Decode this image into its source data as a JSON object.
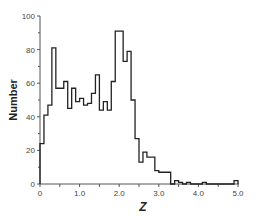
{
  "chart_data": {
    "type": "bar",
    "subtype": "step-histogram",
    "title": "",
    "xlabel": "Z",
    "ylabel": "Number",
    "xlim": [
      0,
      5.0
    ],
    "ylim": [
      0,
      100
    ],
    "bin_width": 0.1,
    "x_ticks": [
      0,
      1.0,
      2.0,
      3.0,
      4.0,
      5.0
    ],
    "x_tick_labels": [
      "0",
      "1.0",
      "2.0",
      "3.0",
      "4.0",
      "5.0"
    ],
    "y_ticks": [
      0,
      20,
      40,
      60,
      80,
      100
    ],
    "y_tick_labels": [
      "0",
      "20",
      "40",
      "60",
      "80",
      "100"
    ],
    "grid": false,
    "legend": null,
    "bin_starts": [
      0.0,
      0.1,
      0.2,
      0.3,
      0.4,
      0.5,
      0.6,
      0.7,
      0.8,
      0.9,
      1.0,
      1.1,
      1.2,
      1.3,
      1.4,
      1.5,
      1.6,
      1.7,
      1.8,
      1.9,
      2.0,
      2.1,
      2.2,
      2.3,
      2.4,
      2.5,
      2.6,
      2.7,
      2.8,
      2.9,
      3.0,
      3.1,
      3.2,
      3.3,
      3.4,
      3.5,
      3.6,
      3.7,
      3.8,
      3.9,
      4.0,
      4.1,
      4.2,
      4.3,
      4.4,
      4.5,
      4.6,
      4.7,
      4.8,
      4.9
    ],
    "values": [
      24,
      41,
      47,
      81,
      57,
      57,
      61,
      45,
      57,
      49,
      51,
      47,
      48,
      54,
      65,
      44,
      49,
      44,
      61,
      91,
      91,
      73,
      79,
      50,
      27,
      13,
      19,
      16,
      16,
      8,
      7,
      7,
      7,
      0,
      2,
      1,
      0,
      1,
      0,
      0,
      0,
      1,
      0,
      0,
      0,
      0,
      0,
      0,
      0,
      2
    ]
  }
}
